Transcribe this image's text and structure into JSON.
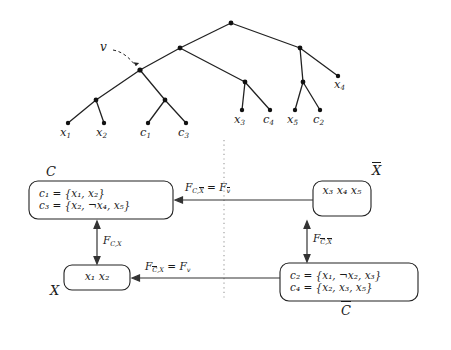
{
  "figure": {
    "colors": {
      "ink": "#1a1a1a",
      "line": "#333333",
      "dotted_separator": "#999999",
      "background": "#ffffff"
    },
    "tree": {
      "name": "binary-tree",
      "pointer_label": "v",
      "leaf_labels": [
        {
          "id": "leaf-x1",
          "base": "x",
          "sub": "1"
        },
        {
          "id": "leaf-x2",
          "base": "x",
          "sub": "2"
        },
        {
          "id": "leaf-c1",
          "base": "c",
          "sub": "1"
        },
        {
          "id": "leaf-c3",
          "base": "c",
          "sub": "3"
        },
        {
          "id": "leaf-x3",
          "base": "x",
          "sub": "3"
        },
        {
          "id": "leaf-c4",
          "base": "c",
          "sub": "4"
        },
        {
          "id": "leaf-x5",
          "base": "x",
          "sub": "5"
        },
        {
          "id": "leaf-c2",
          "base": "c",
          "sub": "2"
        },
        {
          "id": "leaf-x4",
          "base": "x",
          "sub": "4"
        }
      ]
    },
    "boxes": {
      "clause_left": {
        "outer_label": "C",
        "lines": [
          "c₁ = {x₁, x₂}",
          "c₃ = {x₂, ¬x₄, x₅}"
        ]
      },
      "vars_right": {
        "outer_label": "X",
        "outer_label_bar": true,
        "lines": [
          "x₃   x₄",
          "x₅"
        ]
      },
      "vars_left": {
        "outer_label": "X",
        "outer_label_bar": false,
        "lines": [
          "x₁   x₂"
        ]
      },
      "clause_right": {
        "outer_label": "C",
        "outer_label_bar": true,
        "lines": [
          "c₂ = {x₁, ¬x₂, x₃}",
          "c₄ = {x₂, x₃, x₅}"
        ]
      }
    },
    "arrows": {
      "top_horizontal": {
        "label": "F_{C,X̄} = F_{v̄}",
        "direction": "left",
        "from": "vars_right",
        "to": "clause_left"
      },
      "bottom_horizontal": {
        "label": "F_{C̄,X} = F_{v}",
        "direction": "left",
        "from": "clause_right",
        "to": "vars_left"
      },
      "left_vertical": {
        "label": "F_{C,X}",
        "direction": "both",
        "from": "vars_left",
        "to": "clause_left"
      },
      "right_vertical": {
        "label": "F_{C̄,X̄}",
        "direction": "both",
        "from": "clause_right",
        "to": "vars_right"
      }
    },
    "separator": {
      "name": "dotted-vertical-separator",
      "style": "dotted"
    }
  }
}
